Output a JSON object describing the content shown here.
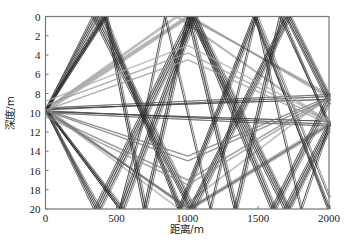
{
  "chart_data": {
    "type": "line",
    "title": "",
    "xlabel": "距离/m",
    "ylabel": "深度/m",
    "xlim": [
      0,
      2000
    ],
    "ylim": [
      0,
      20
    ],
    "y_inverted": true,
    "grid": false,
    "legend": "none",
    "xticks": [
      0,
      500,
      1000,
      1500,
      2000
    ],
    "xtick_labels": [
      "0",
      "500",
      "1000",
      "1500",
      "2000"
    ],
    "yticks": [
      0,
      2,
      4,
      6,
      8,
      10,
      12,
      14,
      16,
      18,
      20
    ],
    "ytick_labels": [
      "0",
      "2",
      "4",
      "6",
      "8",
      "10",
      "12",
      "14",
      "16",
      "18",
      "20"
    ],
    "source": {
      "x": 0,
      "depth": 9.7
    },
    "receivers": [
      {
        "x": 2000,
        "depth": 8.3
      },
      {
        "x": 2000,
        "depth": 11.2
      }
    ],
    "ray_description": "Ray paths from a source at x=0 to receivers at x=2000, reflecting between the surface (0 m) and bottom (20 m)",
    "series": [
      {
        "name": "direct-up-1",
        "color": "#555555",
        "points": [
          [
            0,
            9.7
          ],
          [
            2000,
            8.3
          ]
        ]
      },
      {
        "name": "direct-up-2",
        "color": "#666666",
        "points": [
          [
            0,
            9.5
          ],
          [
            2000,
            8.1
          ]
        ]
      },
      {
        "name": "direct-dn-1",
        "color": "#555555",
        "points": [
          [
            0,
            9.8
          ],
          [
            2000,
            11.2
          ]
        ]
      },
      {
        "name": "direct-dn-2",
        "color": "#666666",
        "points": [
          [
            0,
            10.0
          ],
          [
            2000,
            11.4
          ]
        ]
      },
      {
        "name": "flat-1",
        "color": "#444444",
        "points": [
          [
            0,
            9.6
          ],
          [
            2000,
            8.6
          ]
        ]
      },
      {
        "name": "flat-2",
        "color": "#444444",
        "points": [
          [
            0,
            9.9
          ],
          [
            2000,
            10.9
          ]
        ]
      },
      {
        "name": "surf1-a",
        "color": "#888888",
        "points": [
          [
            0,
            9.7
          ],
          [
            1005,
            0
          ],
          [
            2000,
            8.3
          ]
        ]
      },
      {
        "name": "surf1-b",
        "color": "#999999",
        "points": [
          [
            0,
            9.5
          ],
          [
            990,
            0
          ],
          [
            2000,
            8.1
          ]
        ]
      },
      {
        "name": "surf1-c",
        "color": "#999999",
        "points": [
          [
            0,
            9.9
          ],
          [
            1020,
            0
          ],
          [
            2000,
            8.5
          ]
        ]
      },
      {
        "name": "surf1r-a",
        "color": "#999999",
        "points": [
          [
            0,
            9.7
          ],
          [
            930,
            0
          ],
          [
            2000,
            11.2
          ]
        ]
      },
      {
        "name": "surf1r-b",
        "color": "#aaaaaa",
        "points": [
          [
            0,
            9.6
          ],
          [
            915,
            0
          ],
          [
            2000,
            11.0
          ]
        ]
      },
      {
        "name": "bot1-a",
        "color": "#888888",
        "points": [
          [
            0,
            9.7
          ],
          [
            1010,
            20
          ],
          [
            2000,
            11.2
          ]
        ]
      },
      {
        "name": "bot1-b",
        "color": "#999999",
        "points": [
          [
            0,
            9.5
          ],
          [
            995,
            20
          ],
          [
            2000,
            11.0
          ]
        ]
      },
      {
        "name": "bot1-c",
        "color": "#999999",
        "points": [
          [
            0,
            9.9
          ],
          [
            1025,
            20
          ],
          [
            2000,
            11.4
          ]
        ]
      },
      {
        "name": "bot1r-a",
        "color": "#999999",
        "points": [
          [
            0,
            9.7
          ],
          [
            940,
            20
          ],
          [
            2000,
            8.3
          ]
        ]
      },
      {
        "name": "sb-a",
        "color": "#333333",
        "points": [
          [
            0,
            9.7
          ],
          [
            330,
            0
          ],
          [
            1010,
            20
          ],
          [
            1690,
            0
          ],
          [
            2000,
            9.1
          ]
        ]
      },
      {
        "name": "sb-b",
        "color": "#333333",
        "points": [
          [
            0,
            9.6
          ],
          [
            345,
            0
          ],
          [
            1020,
            20
          ],
          [
            1700,
            0
          ],
          [
            2000,
            8.8
          ]
        ]
      },
      {
        "name": "sb-c",
        "color": "#444444",
        "points": [
          [
            0,
            9.8
          ],
          [
            360,
            0
          ],
          [
            1035,
            20
          ],
          [
            1715,
            0
          ],
          [
            2000,
            8.4
          ]
        ]
      },
      {
        "name": "sb-d",
        "color": "#444444",
        "points": [
          [
            0,
            9.9
          ],
          [
            375,
            0
          ],
          [
            1050,
            20
          ],
          [
            1725,
            0
          ],
          [
            2000,
            8.2
          ]
        ]
      },
      {
        "name": "bs-a",
        "color": "#333333",
        "points": [
          [
            0,
            9.7
          ],
          [
            340,
            20
          ],
          [
            1010,
            0
          ],
          [
            1680,
            20
          ],
          [
            2000,
            10.9
          ]
        ]
      },
      {
        "name": "bs-b",
        "color": "#333333",
        "points": [
          [
            0,
            9.6
          ],
          [
            355,
            20
          ],
          [
            1025,
            0
          ],
          [
            1695,
            20
          ],
          [
            2000,
            11.2
          ]
        ]
      },
      {
        "name": "bs-c",
        "color": "#444444",
        "points": [
          [
            0,
            9.8
          ],
          [
            370,
            20
          ],
          [
            1040,
            0
          ],
          [
            1710,
            20
          ],
          [
            2000,
            11.6
          ]
        ]
      },
      {
        "name": "bs-d",
        "color": "#444444",
        "points": [
          [
            0,
            9.9
          ],
          [
            385,
            20
          ],
          [
            1055,
            0
          ],
          [
            1720,
            20
          ],
          [
            2000,
            11.9
          ]
        ]
      },
      {
        "name": "sbs-a",
        "color": "#222222",
        "points": [
          [
            0,
            9.7
          ],
          [
            400,
            0
          ],
          [
            935,
            20
          ],
          [
            1465,
            0
          ],
          [
            2000,
            20
          ]
        ]
      },
      {
        "name": "sbs-b",
        "color": "#333333",
        "points": [
          [
            0,
            9.6
          ],
          [
            410,
            0
          ],
          [
            945,
            20
          ],
          [
            1475,
            0
          ],
          [
            1990,
            20
          ],
          [
            2000,
            19.6
          ]
        ]
      },
      {
        "name": "sbs-c",
        "color": "#444444",
        "points": [
          [
            0,
            9.8
          ],
          [
            420,
            0
          ],
          [
            955,
            20
          ],
          [
            1490,
            0
          ],
          [
            2000,
            18.8
          ]
        ]
      },
      {
        "name": "bsb-a",
        "color": "#222222",
        "points": [
          [
            0,
            9.7
          ],
          [
            520,
            20
          ],
          [
            1030,
            0
          ],
          [
            1590,
            20
          ],
          [
            2000,
            8.0
          ]
        ]
      },
      {
        "name": "bsb-b",
        "color": "#333333",
        "points": [
          [
            0,
            9.6
          ],
          [
            535,
            20
          ],
          [
            1045,
            0
          ],
          [
            1605,
            20
          ],
          [
            2000,
            8.5
          ]
        ]
      },
      {
        "name": "bsb-c",
        "color": "#444444",
        "points": [
          [
            0,
            9.8
          ],
          [
            550,
            20
          ],
          [
            1060,
            0
          ],
          [
            1620,
            20
          ],
          [
            2000,
            9.0
          ]
        ]
      },
      {
        "name": "sbs2-a",
        "color": "#222222",
        "points": [
          [
            0,
            9.7
          ],
          [
            420,
            0
          ],
          [
            690,
            20
          ],
          [
            1000,
            0
          ],
          [
            1330,
            20
          ],
          [
            1650,
            0
          ],
          [
            2000,
            11.2
          ]
        ]
      },
      {
        "name": "sbs2-b",
        "color": "#333333",
        "points": [
          [
            0,
            9.6
          ],
          [
            430,
            0
          ],
          [
            705,
            20
          ],
          [
            1015,
            0
          ],
          [
            1345,
            20
          ],
          [
            1665,
            0
          ],
          [
            2000,
            11.5
          ]
        ]
      },
      {
        "name": "bsb2-a",
        "color": "#222222",
        "points": [
          [
            0,
            9.7
          ],
          [
            520,
            20
          ],
          [
            700,
            10
          ],
          [
            840,
            0
          ],
          [
            1160,
            20
          ],
          [
            1480,
            0
          ],
          [
            1800,
            20
          ],
          [
            2000,
            11.2
          ]
        ]
      },
      {
        "name": "long-sb-1",
        "color": "#666666",
        "points": [
          [
            0,
            9.7
          ],
          [
            1010,
            20
          ],
          [
            2000,
            11.2
          ]
        ]
      },
      {
        "name": "long-up-1",
        "color": "#777777",
        "points": [
          [
            0,
            9.7
          ],
          [
            1000,
            14.5
          ],
          [
            2000,
            8.3
          ]
        ]
      },
      {
        "name": "long-up-2",
        "color": "#777777",
        "points": [
          [
            0,
            9.8
          ],
          [
            1000,
            15.0
          ],
          [
            2000,
            8.5
          ]
        ]
      },
      {
        "name": "long-dn-1",
        "color": "#777777",
        "points": [
          [
            0,
            10.2
          ],
          [
            1000,
            17.0
          ],
          [
            2000,
            8.3
          ]
        ]
      },
      {
        "name": "long-dn-2",
        "color": "#888888",
        "points": [
          [
            0,
            10.4
          ],
          [
            1000,
            17.5
          ],
          [
            2000,
            8.5
          ]
        ]
      },
      {
        "name": "up-fan-1",
        "color": "#999999",
        "points": [
          [
            0,
            9.7
          ],
          [
            1000,
            4.5
          ],
          [
            2000,
            11.2
          ]
        ]
      },
      {
        "name": "up-fan-2",
        "color": "#999999",
        "points": [
          [
            0,
            9.2
          ],
          [
            1000,
            3.8
          ],
          [
            2000,
            11.0
          ]
        ]
      },
      {
        "name": "up-fan-3",
        "color": "#aaaaaa",
        "points": [
          [
            0,
            8.8
          ],
          [
            1000,
            3.0
          ],
          [
            2000,
            10.8
          ]
        ]
      }
    ]
  }
}
